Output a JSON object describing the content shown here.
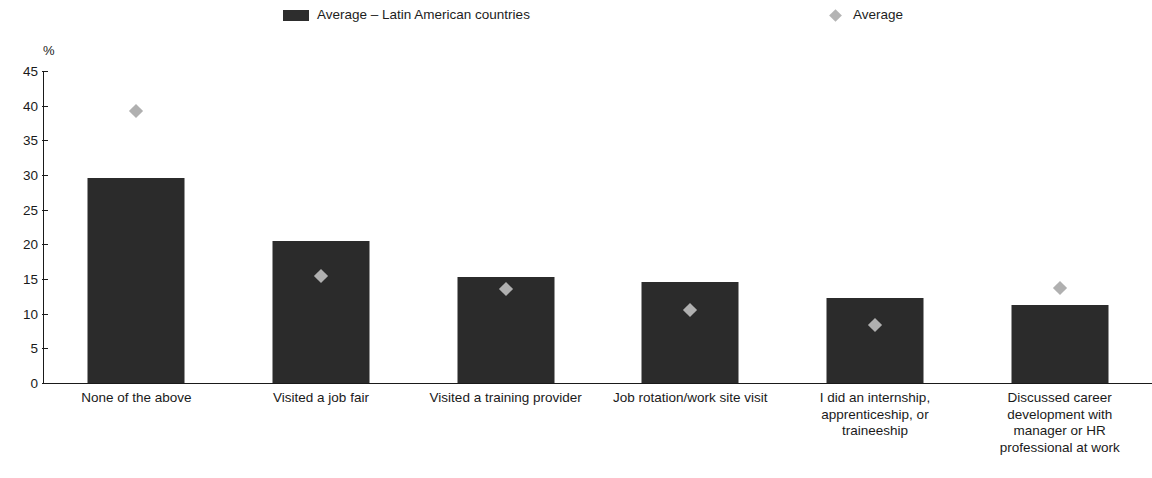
{
  "legend": {
    "position": "top",
    "entries": [
      {
        "label": "Average – Latin American countries",
        "marker": "bar-swatch",
        "color": "#2d2d2d"
      },
      {
        "label": "Average",
        "marker": "diamond",
        "color": "#b4b4b4"
      }
    ]
  },
  "axes": {
    "y_unit": "%",
    "y_ticks": [
      "45",
      "40",
      "35",
      "30",
      "25",
      "20",
      "15",
      "10",
      "5",
      "0"
    ]
  },
  "chart_data": {
    "type": "bar",
    "title": "",
    "subtitle": "",
    "xlabel": "",
    "ylabel": "%",
    "ylim": [
      0,
      45
    ],
    "y_ticks": [
      0,
      5,
      10,
      15,
      20,
      25,
      30,
      35,
      40,
      45
    ],
    "grid": false,
    "legend_position": "top",
    "categories": [
      "None of the above",
      "Visited a job fair",
      "Visited a training provider",
      "Job rotation/work site visit",
      "I did an internship, apprenticeship, or traineeship",
      "Discussed career development with manager or HR professional at work"
    ],
    "category_lines": [
      [
        "None of the above"
      ],
      [
        "Visited a job fair"
      ],
      [
        "Visited a training provider"
      ],
      [
        "Job rotation/work site visit"
      ],
      [
        "I did an internship,",
        "apprenticeship, or",
        "traineeship"
      ],
      [
        "Discussed career",
        "development with",
        "manager or HR",
        "professional at work"
      ]
    ],
    "series": [
      {
        "name": "Average – Latin American countries",
        "type": "bar",
        "color": "#2b2b2b",
        "values": [
          29.6,
          20.5,
          15.3,
          14.5,
          12.3,
          11.3
        ]
      },
      {
        "name": "Average",
        "type": "scatter",
        "marker": "diamond",
        "color": "#b0b0b0",
        "values": [
          39.3,
          15.5,
          13.6,
          10.6,
          8.4,
          13.7
        ]
      }
    ]
  }
}
